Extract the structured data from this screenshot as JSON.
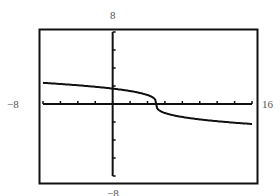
{
  "chart_data": {
    "type": "line",
    "title": "",
    "xlabel": "",
    "ylabel": "",
    "function_hint": "y = -cbrt(x - 5)",
    "xlim": [
      -8,
      16
    ],
    "ylim": [
      -8,
      8
    ],
    "x_tick_step": 2,
    "y_tick_step": 2,
    "grid": false,
    "legend": null,
    "window_labels": {
      "xmin": "−8",
      "xmax": "16",
      "ymin": "−8",
      "ymax": "8"
    },
    "series": [
      {
        "name": "curve",
        "x": [
          -8,
          -6,
          -4,
          -2,
          0,
          2,
          3,
          4,
          4.5,
          5,
          5.5,
          6,
          7,
          8,
          10,
          12,
          14,
          16
        ],
        "y": [
          2.35,
          2.22,
          2.08,
          1.91,
          1.71,
          1.44,
          1.26,
          1.0,
          0.79,
          0,
          -0.79,
          -1.0,
          -1.26,
          -1.44,
          -1.71,
          -1.91,
          -2.08,
          -2.22
        ]
      }
    ]
  },
  "colors": {
    "frame": "#111111",
    "axis": "#111111",
    "curve": "#111111",
    "label": "#555555"
  }
}
